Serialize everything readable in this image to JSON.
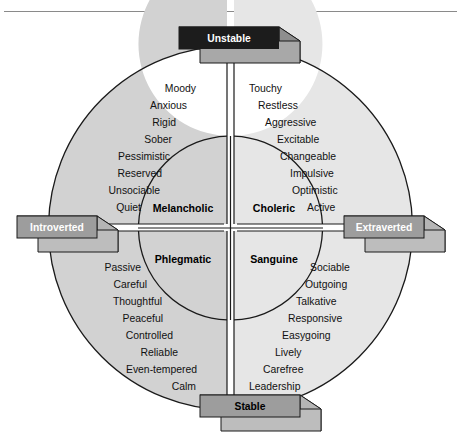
{
  "figure": {
    "title_rule": true,
    "colors": {
      "ring_left": "#d2d2d2",
      "ring_right": "#e4e4e4",
      "inner": "#ffffff",
      "stroke": "#1a1a1a",
      "unstable_box": "#1c1c1c",
      "unstable_box_side": "#8f8f8f",
      "unstable_box_top": "#b5b5b5",
      "axis_box": "#9a9a9a",
      "axis_box_side": "#b8b8b8",
      "axis_box_top": "#cccccc",
      "text": "#111111"
    }
  },
  "axes": {
    "top": {
      "label": "Unstable",
      "style": "dark"
    },
    "bottom": {
      "label": "Stable",
      "style": "light"
    },
    "left": {
      "label": "Introverted",
      "style": "light"
    },
    "right": {
      "label": "Extraverted",
      "style": "light"
    }
  },
  "quadrants": [
    {
      "key": "melancholic",
      "center_label": "Melancholic",
      "position": "top-left",
      "traits": [
        "Moody",
        "Anxious",
        "Rigid",
        "Sober",
        "Pessimistic",
        "Reserved",
        "Unsociable",
        "Quiet"
      ]
    },
    {
      "key": "choleric",
      "center_label": "Choleric",
      "position": "top-right",
      "traits": [
        "Touchy",
        "Restless",
        "Aggressive",
        "Excitable",
        "Changeable",
        "Impulsive",
        "Optimistic",
        "Active"
      ]
    },
    {
      "key": "phlegmatic",
      "center_label": "Phlegmatic",
      "position": "bottom-left",
      "traits": [
        "Passive",
        "Careful",
        "Thoughtful",
        "Peaceful",
        "Controlled",
        "Reliable",
        "Even-tempered",
        "Calm"
      ]
    },
    {
      "key": "sanguine",
      "center_label": "Sanguine",
      "position": "bottom-right",
      "traits": [
        "Sociable",
        "Outgoing",
        "Talkative",
        "Responsive",
        "Easygoing",
        "Lively",
        "Carefree",
        "Leadership"
      ]
    }
  ],
  "trait_layout": {
    "melancholic": [
      {
        "x": 196,
        "y": 92,
        "anchor": "end"
      },
      {
        "x": 187,
        "y": 109,
        "anchor": "end"
      },
      {
        "x": 176,
        "y": 126,
        "anchor": "end"
      },
      {
        "x": 172,
        "y": 143,
        "anchor": "end"
      },
      {
        "x": 170,
        "y": 160,
        "anchor": "end"
      },
      {
        "x": 162,
        "y": 177,
        "anchor": "end"
      },
      {
        "x": 160,
        "y": 194,
        "anchor": "end"
      },
      {
        "x": 141,
        "y": 211,
        "anchor": "end"
      }
    ],
    "choleric": [
      {
        "x": 249,
        "y": 92,
        "anchor": "start"
      },
      {
        "x": 258,
        "y": 109,
        "anchor": "start"
      },
      {
        "x": 265,
        "y": 126,
        "anchor": "start"
      },
      {
        "x": 277,
        "y": 143,
        "anchor": "start"
      },
      {
        "x": 280,
        "y": 160,
        "anchor": "start"
      },
      {
        "x": 290,
        "y": 177,
        "anchor": "start"
      },
      {
        "x": 292,
        "y": 194,
        "anchor": "start"
      },
      {
        "x": 307,
        "y": 211,
        "anchor": "start"
      }
    ],
    "phlegmatic": [
      {
        "x": 141,
        "y": 271,
        "anchor": "end"
      },
      {
        "x": 147,
        "y": 288,
        "anchor": "end"
      },
      {
        "x": 162,
        "y": 305,
        "anchor": "end"
      },
      {
        "x": 163,
        "y": 322,
        "anchor": "end"
      },
      {
        "x": 173,
        "y": 339,
        "anchor": "end"
      },
      {
        "x": 178,
        "y": 356,
        "anchor": "end"
      },
      {
        "x": 197,
        "y": 373,
        "anchor": "end"
      },
      {
        "x": 196,
        "y": 390,
        "anchor": "end"
      }
    ],
    "sanguine": [
      {
        "x": 310,
        "y": 271,
        "anchor": "start"
      },
      {
        "x": 305,
        "y": 288,
        "anchor": "start"
      },
      {
        "x": 296,
        "y": 305,
        "anchor": "start"
      },
      {
        "x": 288,
        "y": 322,
        "anchor": "start"
      },
      {
        "x": 282,
        "y": 339,
        "anchor": "start"
      },
      {
        "x": 275,
        "y": 356,
        "anchor": "start"
      },
      {
        "x": 263,
        "y": 373,
        "anchor": "start"
      },
      {
        "x": 249,
        "y": 390,
        "anchor": "start"
      }
    ]
  },
  "center_label_positions": {
    "melancholic": {
      "x": 183,
      "y": 212
    },
    "choleric": {
      "x": 272,
      "y": 212
    },
    "phlegmatic": {
      "x": 183,
      "y": 262
    },
    "sanguine": {
      "x": 272,
      "y": 262
    }
  }
}
